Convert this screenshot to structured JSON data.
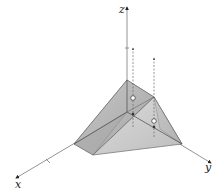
{
  "diagram": {
    "type": "3d-solid-region",
    "axes": {
      "x": {
        "label": "x"
      },
      "y": {
        "label": "y"
      },
      "z": {
        "label": "z"
      }
    },
    "colors": {
      "axis": "#7a7a7a",
      "face_light": "#d4d4d4",
      "face_mid": "#b4b4b4",
      "face_dark": "#9c9c9c",
      "edge": "#5a5a5a",
      "dashed": "#6a6a6a"
    },
    "vertical_lines": [
      {
        "name": "line-1",
        "has_open_point": true,
        "has_filled_point": true
      },
      {
        "name": "line-2",
        "has_open_point": true,
        "has_filled_point": true
      }
    ]
  }
}
